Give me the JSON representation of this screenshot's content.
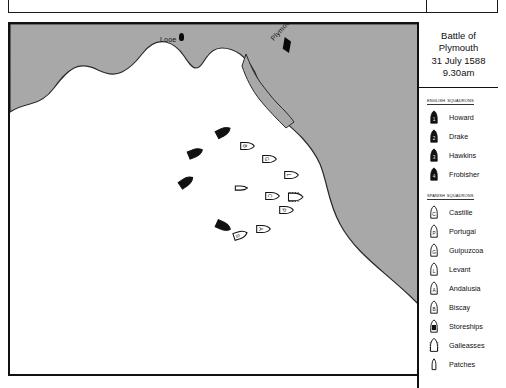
{
  "map": {
    "title_lines": [
      "Battle of",
      "Plymouth",
      "31 July 1588",
      "9.30am"
    ],
    "places": [
      {
        "name": "Looe",
        "label": "Looe",
        "x": 150,
        "y": 12,
        "dot_x": 169,
        "dot_y": 9,
        "rotation": 0
      },
      {
        "name": "Plymouth",
        "label": "Plymouth",
        "x": 262,
        "y": 12,
        "dot_x": 272,
        "dot_y": 13,
        "rotation": -48
      }
    ],
    "land_color": "#a8a8a8",
    "sea_color": "#ffffff",
    "border_color": "#111111"
  },
  "legend": {
    "english_header": "English Squadrons",
    "spanish_header": "Spanish Squadrons",
    "english": [
      {
        "label": "Howard",
        "mark": "1"
      },
      {
        "label": "Drake",
        "mark": "2"
      },
      {
        "label": "Hawkins",
        "mark": "3"
      },
      {
        "label": "Frobisher",
        "mark": "4"
      }
    ],
    "spanish": [
      {
        "label": "Castille",
        "mark": "C",
        "shape": "ship"
      },
      {
        "label": "Portugal",
        "mark": "P",
        "shape": "ship"
      },
      {
        "label": "Guipuzcoa",
        "mark": "G",
        "shape": "ship"
      },
      {
        "label": "Levant",
        "mark": "L",
        "shape": "ship"
      },
      {
        "label": "Andalusia",
        "mark": "A",
        "shape": "ship"
      },
      {
        "label": "Biscay",
        "mark": "B",
        "shape": "ship"
      },
      {
        "label": "Storeships",
        "mark": "S",
        "shape": "storeship"
      },
      {
        "label": "Galleasses",
        "mark": "",
        "shape": "galleass"
      },
      {
        "label": "Patches",
        "mark": "",
        "shape": "patache"
      }
    ]
  },
  "fleet": {
    "english_ships": [
      {
        "x": 213,
        "y": 108,
        "rot": -28
      },
      {
        "x": 185,
        "y": 129,
        "rot": -22
      },
      {
        "x": 176,
        "y": 158,
        "rot": -34
      },
      {
        "x": 213,
        "y": 202,
        "rot": 24
      }
    ],
    "spanish_ships": [
      {
        "x": 237,
        "y": 122,
        "rot": 0,
        "mark": "B",
        "shape": "ship"
      },
      {
        "x": 259,
        "y": 135,
        "rot": 0,
        "mark": "G",
        "shape": "ship"
      },
      {
        "x": 281,
        "y": 151,
        "rot": 0,
        "mark": "L",
        "shape": "ship"
      },
      {
        "x": 285,
        "y": 173,
        "rot": 0,
        "mark": "",
        "shape": "galleass"
      },
      {
        "x": 262,
        "y": 172,
        "rot": 0,
        "mark": "C",
        "shape": "ship"
      },
      {
        "x": 276,
        "y": 186,
        "rot": 0,
        "mark": "P",
        "shape": "ship"
      },
      {
        "x": 253,
        "y": 205,
        "rot": 0,
        "mark": "A",
        "shape": "ship"
      },
      {
        "x": 230,
        "y": 211,
        "rot": -18,
        "mark": "S",
        "shape": "ship"
      },
      {
        "x": 231,
        "y": 164,
        "rot": 0,
        "mark": "",
        "shape": "patache"
      }
    ]
  }
}
